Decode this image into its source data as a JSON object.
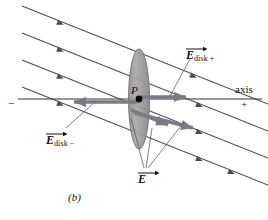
{
  "figure": {
    "caption": "(b)",
    "point_label": "P",
    "axis_label": "axis",
    "axis_positive_sign": "+",
    "axis_negative_sign": "−",
    "labels": {
      "e_disk_plus": {
        "symbol": "E",
        "subscript": "disk +"
      },
      "e_disk_minus": {
        "symbol": "E",
        "subscript": "disk −"
      },
      "e_prime": {
        "symbol": "E",
        "subscript": ""
      }
    },
    "colors": {
      "line": "#4a4a52",
      "vector": "#6e6e78",
      "disk_fill": "#9b9b9b",
      "disk_stroke": "#6a6a6a",
      "text": "#111111",
      "point": "#000000",
      "background": "#ffffff"
    },
    "field_lines": {
      "count": 4,
      "direction": "down-right",
      "arrow_markers_per_line": 2
    },
    "vectors": [
      {
        "name": "e-disk-plus-vector",
        "direction": "right",
        "from": "P"
      },
      {
        "name": "e-disk-minus-vector",
        "direction": "left",
        "from": "P"
      },
      {
        "name": "e-prime-vector-1",
        "direction": "down-right",
        "from": "P"
      },
      {
        "name": "e-prime-vector-2",
        "direction": "down-right",
        "from": "P"
      }
    ]
  }
}
